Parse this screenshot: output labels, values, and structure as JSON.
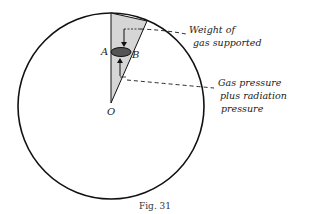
{
  "figure": {
    "caption": "Fig. 31",
    "points": {
      "a": "A",
      "b": "B",
      "o": "O"
    },
    "annotations": {
      "weight_line1": "Weight of",
      "weight_line2": "gas supported",
      "pressure_line1": "Gas pressure",
      "pressure_line2": "plus radiation",
      "pressure_line3": "pressure"
    },
    "colors": {
      "stroke": "#111111",
      "cone_fill": "#d6d6d6",
      "element_fill": "#555555"
    }
  }
}
